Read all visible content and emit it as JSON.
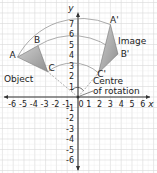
{
  "diagram": {
    "type": "rotation-on-coordinate-grid",
    "axes": {
      "x_label": "x",
      "y_label": "y",
      "x_ticks": [
        "-6",
        "-5",
        "-4",
        "-3",
        "-2",
        "-1",
        "0",
        "1",
        "2",
        "3",
        "4",
        "5",
        "6"
      ],
      "y_ticks": [
        "7",
        "6",
        "5",
        "4",
        "3",
        "2",
        "1",
        "-1",
        "-2",
        "-3",
        "-4",
        "-5",
        "-6"
      ],
      "x_range": [
        -6.5,
        6.5
      ],
      "y_range": [
        -6.5,
        7.5
      ]
    },
    "object": {
      "label": "Object",
      "vertices": [
        {
          "name": "A",
          "x": -5.6,
          "y": 3.8
        },
        {
          "name": "B",
          "x": -3.7,
          "y": 4.9
        },
        {
          "name": "C",
          "x": -2.8,
          "y": 2.4
        }
      ]
    },
    "image": {
      "label": "Image",
      "vertices": [
        {
          "name": "A'",
          "x": 3.0,
          "y": 6.9
        },
        {
          "name": "B'",
          "x": 3.7,
          "y": 4.1
        },
        {
          "name": "C'",
          "x": 1.9,
          "y": 2.3
        }
      ]
    },
    "centre": {
      "label_line1": "Centre",
      "label_line2": "of rotation",
      "x": 0,
      "y": 0
    },
    "colors": {
      "grid": "#d9d9d9",
      "axis": "#333333",
      "triangle_fill": "#a8a8a8",
      "triangle_stroke": "#777777",
      "arc": "#888888",
      "dashed": "#999999"
    }
  }
}
